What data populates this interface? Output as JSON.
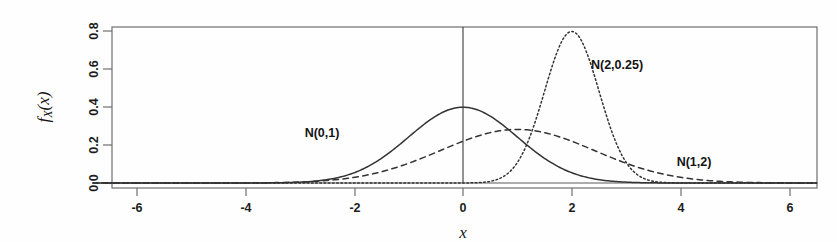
{
  "chart_data": {
    "type": "line",
    "title": "",
    "subtitle": "",
    "xlabel": "x",
    "ylabel": "f_X(x)",
    "xlim": [
      -6.8,
      6.5
    ],
    "ylim": [
      0.0,
      0.85
    ],
    "xticks": [
      -6,
      -4,
      -2,
      0,
      2,
      4,
      6
    ],
    "xticklabels": [
      "-6",
      "-4",
      "-2",
      "0",
      "2",
      "4",
      "6"
    ],
    "yticks": [
      0.0,
      0.2,
      0.4,
      0.6,
      0.8
    ],
    "yticklabels": [
      "0.0",
      "0.2",
      "0.4",
      "0.6",
      "0.8"
    ],
    "grid": false,
    "legend_position": "inline-annotations",
    "vertical_reference_line_x": 0,
    "series": [
      {
        "name": "N(0,1)",
        "mean": 0,
        "variance": 1,
        "sd": 1,
        "peak_x": 0,
        "peak_y": 0.399,
        "linestyle": "solid",
        "color": "#333333",
        "annotation": "N(0,1)",
        "annotation_x": -2.45,
        "annotation_y": 0.28
      },
      {
        "name": "N(2,0.25)",
        "mean": 2,
        "variance": 0.25,
        "sd": 0.5,
        "peak_x": 2,
        "peak_y": 0.798,
        "linestyle": "dotted",
        "color": "#333333",
        "annotation": "N(2,0.25)",
        "annotation_x": 2.75,
        "annotation_y": 0.63
      },
      {
        "name": "N(1,2)",
        "mean": 1,
        "variance": 2,
        "sd": 1.4142,
        "peak_x": 1,
        "peak_y": 0.282,
        "linestyle": "dashed",
        "color": "#333333",
        "annotation": "N(1,2)",
        "annotation_x": 4.35,
        "annotation_y": 0.115
      }
    ]
  },
  "axes": {
    "x_axis_label": "x",
    "y_axis_label_parts": {
      "f": "f",
      "sub": "X",
      "arg": "(x)"
    }
  },
  "annotations": {
    "normal_0_1": "N(0,1)",
    "normal_2_025": "N(2,0.25)",
    "normal_1_2": "N(1,2)"
  },
  "ticks": {
    "x": [
      "-6",
      "-4",
      "-2",
      "0",
      "2",
      "4",
      "6"
    ],
    "y": [
      "0.0",
      "0.2",
      "0.4",
      "0.6",
      "0.8"
    ]
  },
  "colors": {
    "line": "#333333",
    "frame": "#6e6e6e",
    "text": "#141414",
    "background": "#fefefe"
  }
}
